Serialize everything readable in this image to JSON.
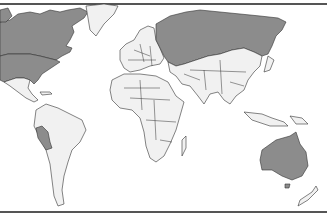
{
  "map": {
    "type": "world-choropleth",
    "colors": {
      "highlighted": "#8c8c8c",
      "land": "#f1f1f1",
      "ocean": "#ffffff",
      "border": "#333333"
    },
    "highlighted_regions": [
      "Canada",
      "United States",
      "Russia",
      "Peru",
      "Australia"
    ]
  }
}
